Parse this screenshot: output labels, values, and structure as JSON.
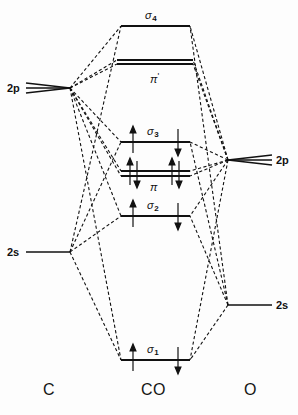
{
  "figure": {
    "type": "molecular-orbital-energy-level-diagram",
    "molecule": "CO",
    "background_color": "#fdfdfd",
    "line_color": "#111111"
  },
  "columns": {
    "left": {
      "key": "C",
      "label": "C",
      "x": 50,
      "y": 391
    },
    "center": {
      "key": "CO",
      "label": "CO",
      "x": 155,
      "y": 391
    },
    "right": {
      "key": "O",
      "label": "O",
      "x": 250,
      "y": 391
    }
  },
  "atomic_orbitals": [
    {
      "id": "c-2p",
      "label": "2p",
      "atom": "C",
      "side": "left",
      "degeneracy": 3,
      "y": 88,
      "x_start": 26,
      "x_end": 70,
      "label_x": 7,
      "label_y": 83
    },
    {
      "id": "c-2s",
      "label": "2s",
      "atom": "C",
      "side": "left",
      "degeneracy": 1,
      "y": 252,
      "x_start": 26,
      "x_end": 70,
      "label_x": 7,
      "label_y": 247
    },
    {
      "id": "o-2p",
      "label": "2p",
      "atom": "O",
      "side": "right",
      "degeneracy": 3,
      "y": 160,
      "x_start": 228,
      "x_end": 272,
      "label_x": 276,
      "label_y": 155
    },
    {
      "id": "o-2s",
      "label": "2s",
      "atom": "O",
      "side": "right",
      "degeneracy": 1,
      "y": 305,
      "x_start": 228,
      "x_end": 272,
      "label_x": 276,
      "label_y": 300
    }
  ],
  "molecular_orbitals": [
    {
      "id": "sigma4",
      "label": "σ",
      "subscript": "4",
      "antibonding": false,
      "degeneracy": 1,
      "y": 26,
      "x_start": 121,
      "x_end": 190,
      "label_x": 145,
      "label_y": 10,
      "electrons": 0
    },
    {
      "id": "pi-star",
      "label": "π",
      "subscript": "",
      "antibonding": true,
      "degeneracy": 2,
      "y": 62,
      "x_start": 117,
      "x_end": 193,
      "label_x": 150,
      "label_y": 72,
      "electrons": 0
    },
    {
      "id": "sigma3",
      "label": "σ",
      "subscript": "3",
      "antibonding": false,
      "degeneracy": 1,
      "y": 142,
      "x_start": 121,
      "x_end": 190,
      "label_x": 147,
      "label_y": 126,
      "electrons": 2
    },
    {
      "id": "pi",
      "label": "π",
      "subscript": "",
      "antibonding": false,
      "degeneracy": 2,
      "y": 173,
      "x_start": 121,
      "x_end": 190,
      "label_x": 150,
      "label_y": 182,
      "electrons": 4
    },
    {
      "id": "sigma2",
      "label": "σ",
      "subscript": "2",
      "antibonding": false,
      "degeneracy": 1,
      "y": 216,
      "x_start": 121,
      "x_end": 190,
      "label_x": 147,
      "label_y": 200,
      "electrons": 2
    },
    {
      "id": "sigma1",
      "label": "σ",
      "subscript": "1",
      "antibonding": false,
      "degeneracy": 1,
      "y": 360,
      "x_start": 121,
      "x_end": 190,
      "label_x": 147,
      "label_y": 344,
      "electrons": 2
    }
  ],
  "electron_arrows": [
    {
      "mo": "sigma3",
      "x": 133,
      "direction": "up"
    },
    {
      "mo": "sigma3",
      "x": 178,
      "direction": "down"
    },
    {
      "mo": "pi",
      "x": 130,
      "direction": "up"
    },
    {
      "mo": "pi",
      "x": 137,
      "direction": "down"
    },
    {
      "mo": "pi",
      "x": 172,
      "direction": "up"
    },
    {
      "mo": "pi",
      "x": 179,
      "direction": "down"
    },
    {
      "mo": "sigma2",
      "x": 133,
      "direction": "up"
    },
    {
      "mo": "sigma2",
      "x": 178,
      "direction": "down"
    },
    {
      "mo": "sigma1",
      "x": 133,
      "direction": "up"
    },
    {
      "mo": "sigma1",
      "x": 178,
      "direction": "down"
    }
  ],
  "correlation_lines": [
    {
      "from": "c-2p",
      "to": "sigma4"
    },
    {
      "from": "c-2p",
      "to": "pi-star"
    },
    {
      "from": "c-2p",
      "to": "sigma3"
    },
    {
      "from": "c-2p",
      "to": "pi"
    },
    {
      "from": "c-2p",
      "to": "sigma2"
    },
    {
      "from": "c-2p",
      "to": "sigma1"
    },
    {
      "from": "c-2s",
      "to": "sigma2"
    },
    {
      "from": "c-2s",
      "to": "sigma3"
    },
    {
      "from": "c-2s",
      "to": "sigma1"
    },
    {
      "from": "c-2s",
      "to": "sigma4"
    },
    {
      "from": "o-2p",
      "to": "sigma4"
    },
    {
      "from": "o-2p",
      "to": "pi-star"
    },
    {
      "from": "o-2p",
      "to": "sigma3"
    },
    {
      "from": "o-2p",
      "to": "pi"
    },
    {
      "from": "o-2p",
      "to": "sigma2"
    },
    {
      "from": "o-2p",
      "to": "sigma1"
    },
    {
      "from": "o-2s",
      "to": "sigma1"
    },
    {
      "from": "o-2s",
      "to": "sigma2"
    },
    {
      "from": "o-2s",
      "to": "sigma3"
    },
    {
      "from": "o-2s",
      "to": "sigma4"
    }
  ]
}
